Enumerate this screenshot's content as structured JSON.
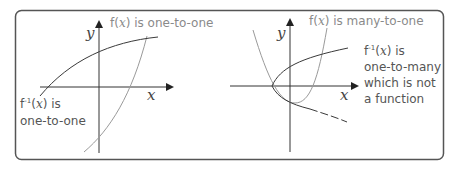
{
  "left": {
    "title": "f(x) is one-to-one",
    "title_parts": [
      "f(",
      "x",
      ") is one-to-one"
    ],
    "axis_y": "y",
    "axis_x": "x",
    "inverse_line1": "f⁻¹(x) is",
    "inverse_line2": "one-to-one",
    "inv_prefix": "f",
    "inv_sup": "-1",
    "inv_open": "(",
    "inv_var": "x",
    "inv_close": ") is"
  },
  "right": {
    "title_parts": [
      "f(",
      "x",
      ") is many-to-one"
    ],
    "axis_y": "y",
    "axis_x": "x",
    "inv_prefix": "f",
    "inv_sup": "-1",
    "inv_open": "(",
    "inv_var": "x",
    "inv_close": ") is",
    "line2": "one-to-many",
    "line3": "which is not",
    "line4": "a function"
  },
  "colors": {
    "frame": "#555555",
    "axis": "#333333",
    "f_curve": "#9a9a9a",
    "inverse_curve": "#3a3a3a",
    "label_gray": "#8a8a8a",
    "label_dark": "#555555"
  }
}
